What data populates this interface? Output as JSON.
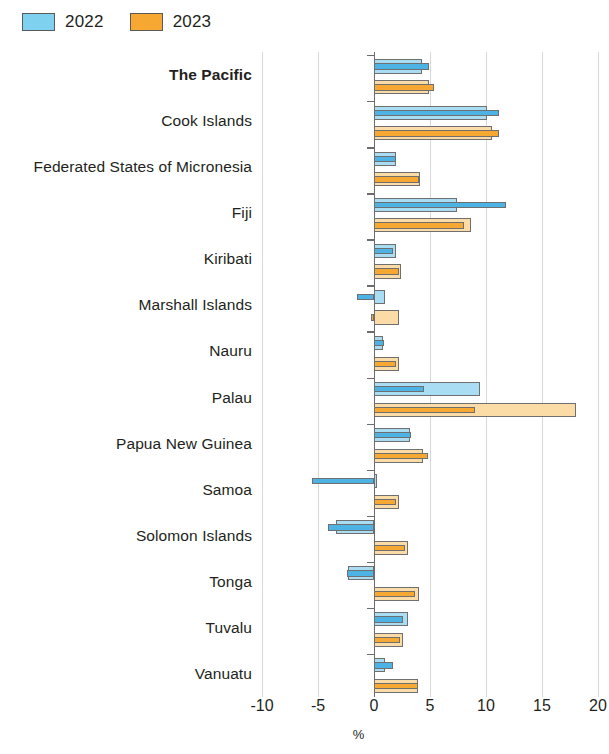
{
  "legend": {
    "items": [
      {
        "label": "2022",
        "color": "#7fd2ef"
      },
      {
        "label": "2023",
        "color": "#f7a833"
      }
    ]
  },
  "axis": {
    "x_ticks": [
      "-10",
      "-5",
      "0",
      "5",
      "10",
      "15",
      "20"
    ],
    "x_title": "%"
  },
  "chart_data": {
    "type": "bar",
    "orientation": "horizontal",
    "title": "",
    "xlabel": "%",
    "ylabel": "",
    "xlim": [
      -10,
      20
    ],
    "xticks": [
      -10,
      -5,
      0,
      5,
      10,
      15,
      20
    ],
    "grid": true,
    "legend_position": "top-left",
    "note": "Each economy shows two pairs of overlapping bars: a pale (outer/estimate) bar and a saturated (inner/actual) bar for each year.",
    "categories": [
      "The Pacific",
      "Cook Islands",
      "Federated States of Micronesia",
      "Fiji",
      "Kiribati",
      "Marshall Islands",
      "Nauru",
      "Palau",
      "Papua New Guinea",
      "Samoa",
      "Solomon Islands",
      "Tonga",
      "Tuvalu",
      "Vanuatu"
    ],
    "emphasized_categories": [
      "The Pacific"
    ],
    "series": [
      {
        "name": "2022",
        "variant": "pale",
        "color": "#a9ddf3",
        "values": [
          4.3,
          10.1,
          2.0,
          7.4,
          2.0,
          1.0,
          0.8,
          9.5,
          3.2,
          0.3,
          -3.4,
          -2.3,
          3.0,
          1.0
        ]
      },
      {
        "name": "2022",
        "variant": "deep",
        "color": "#4db3e4",
        "values": [
          4.9,
          11.2,
          2.0,
          11.8,
          1.7,
          -1.5,
          0.9,
          4.5,
          3.3,
          -5.5,
          -4.1,
          -2.4,
          2.6,
          1.7
        ]
      },
      {
        "name": "2023",
        "variant": "pale",
        "color": "#fbdca7",
        "values": [
          4.9,
          10.5,
          4.1,
          8.7,
          2.4,
          2.2,
          2.2,
          18.0,
          4.4,
          2.2,
          3.0,
          4.0,
          2.6,
          3.9
        ]
      },
      {
        "name": "2023",
        "variant": "deep",
        "color": "#f7a833",
        "values": [
          5.4,
          11.2,
          4.0,
          8.0,
          2.2,
          -0.3,
          2.0,
          9.0,
          4.8,
          2.0,
          2.8,
          3.7,
          2.3,
          3.9
        ]
      }
    ]
  }
}
